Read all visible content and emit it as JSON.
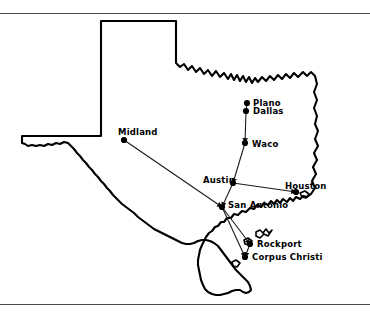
{
  "figure": {
    "background_color": "#ffffff",
    "outline_color": "#000000",
    "route_color": "#1a1a1a",
    "rule_color": "#4a4a4a",
    "marker_color": "#000000"
  },
  "rules": {
    "top_label": "top-divider",
    "bottom_label": "bottom-divider"
  },
  "cities": [
    {
      "id": "plano",
      "name": "Plano",
      "x": 247,
      "y": 103,
      "label_x": 253,
      "label_y": 99
    },
    {
      "id": "dallas",
      "name": "Dallas",
      "x": 246,
      "y": 111,
      "label_x": 253,
      "label_y": 107
    },
    {
      "id": "waco",
      "name": "Waco",
      "x": 245,
      "y": 143,
      "label_x": 252,
      "label_y": 140
    },
    {
      "id": "midland",
      "name": "Midland",
      "x": 124,
      "y": 140,
      "label_x": 118,
      "label_y": 128
    },
    {
      "id": "austin",
      "name": "Austin",
      "x": 233,
      "y": 183,
      "label_x": 203,
      "label_y": 176
    },
    {
      "id": "san-antonio",
      "name": "San Antonio",
      "x": 222,
      "y": 207,
      "label_x": 228,
      "label_y": 201
    },
    {
      "id": "houston",
      "name": "Houston",
      "x": 296,
      "y": 192,
      "label_x": 285,
      "label_y": 182
    },
    {
      "id": "rockport",
      "name": "Rockport",
      "x": 250,
      "y": 244,
      "label_x": 257,
      "label_y": 240
    },
    {
      "id": "corpus-christi",
      "name": "Corpus Christi",
      "x": 245,
      "y": 257,
      "label_x": 252,
      "label_y": 253
    }
  ],
  "routes": [
    {
      "id": "plano-dallas",
      "from": "plano",
      "to": "dallas",
      "directed": false
    },
    {
      "id": "dallas-waco",
      "from": "dallas",
      "to": "waco",
      "directed": true
    },
    {
      "id": "waco-austin",
      "from": "waco",
      "to": "austin",
      "directed": true
    },
    {
      "id": "austin-san-antonio",
      "from": "austin",
      "to": "san-antonio",
      "directed": true
    },
    {
      "id": "austin-houston",
      "from": "austin",
      "to": "houston",
      "directed": true
    },
    {
      "id": "midland-san-antonio",
      "from": "midland",
      "to": "san-antonio",
      "directed": true
    },
    {
      "id": "san-antonio-rockport",
      "from": "san-antonio",
      "to": "rockport",
      "directed": true
    },
    {
      "id": "san-antonio-corpus",
      "from": "san-antonio",
      "to": "corpus-christi",
      "directed": true
    },
    {
      "id": "rockport-corpus",
      "from": "rockport",
      "to": "corpus-christi",
      "directed": true
    }
  ]
}
